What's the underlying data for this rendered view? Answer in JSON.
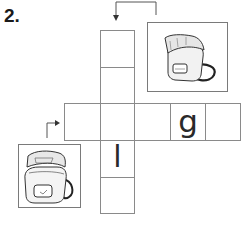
{
  "exercise": {
    "number_label": "2.",
    "down_word": {
      "clue_icon": "lunchbox-icon",
      "arrow": "down",
      "cells": [
        "",
        "",
        "",
        "l",
        ""
      ]
    },
    "across_word": {
      "clue_icon": "lunchbox-icon",
      "arrow": "right",
      "cells": [
        "",
        "",
        "",
        "g",
        ""
      ]
    },
    "letters": {
      "across_4": "g",
      "down_4": "l"
    }
  }
}
